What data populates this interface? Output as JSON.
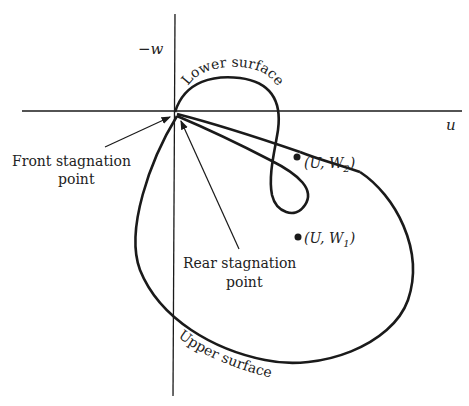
{
  "axes": {
    "horizontal_label": "u",
    "vertical_label": "−w"
  },
  "curve_labels": {
    "lower_surface": "Lower surface",
    "upper_surface": "Upper surface"
  },
  "annotations": {
    "front_stagnation_line1": "Front stagnation",
    "front_stagnation_line2": "point",
    "rear_stagnation_line1": "Rear stagnation",
    "rear_stagnation_line2": "point"
  },
  "points": [
    {
      "label": "(U, W",
      "sub": "2",
      "close": ")"
    },
    {
      "label": "(U, W",
      "sub": "1",
      "close": ")"
    }
  ],
  "colors": {
    "ink": "#1a1a1a",
    "background": "#ffffff"
  }
}
